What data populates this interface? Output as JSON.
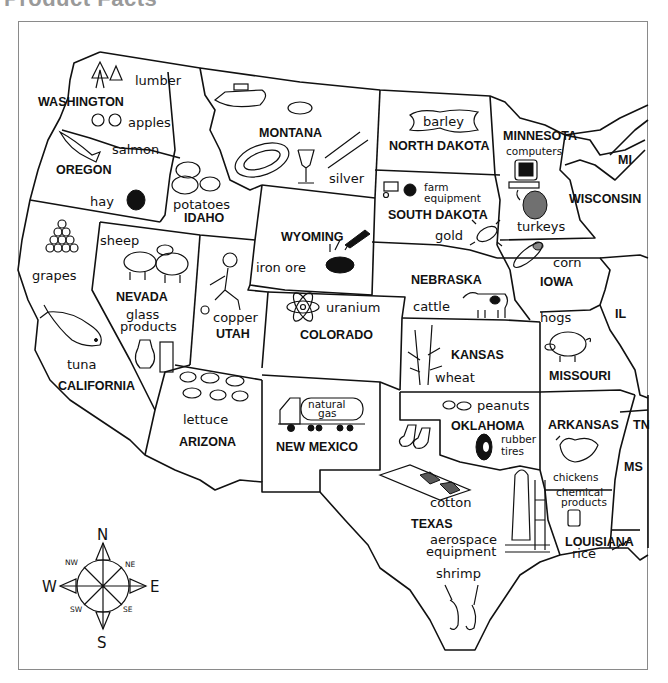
{
  "page": {
    "title": "Product Facts"
  },
  "states": [
    {
      "name": "WASHINGTON",
      "products": [
        "lumber",
        "apples"
      ]
    },
    {
      "name": "OREGON",
      "products": [
        "salmon",
        "hay"
      ]
    },
    {
      "name": "IDAHO",
      "products": [
        "potatoes"
      ]
    },
    {
      "name": "MONTANA",
      "products": [
        "silver"
      ]
    },
    {
      "name": "NORTH DAKOTA",
      "products": [
        "barley"
      ]
    },
    {
      "name": "MINNESOTA",
      "products": [
        "computers",
        "turkeys"
      ]
    },
    {
      "name": "MI",
      "products": []
    },
    {
      "name": "WISCONSIN",
      "products": []
    },
    {
      "name": "SOUTH DAKOTA",
      "products": [
        "farm",
        "equipment",
        "gold"
      ]
    },
    {
      "name": "WYOMING",
      "products": [
        "iron ore"
      ]
    },
    {
      "name": "CALIFORNIA",
      "products": [
        "grapes",
        "tuna"
      ]
    },
    {
      "name": "NEVADA",
      "products": [
        "sheep",
        "glass",
        "products"
      ]
    },
    {
      "name": "UTAH",
      "products": [
        "copper"
      ]
    },
    {
      "name": "COLORADO",
      "products": [
        "uranium"
      ]
    },
    {
      "name": "NEBRASKA",
      "products": [
        "cattle"
      ]
    },
    {
      "name": "IOWA",
      "products": [
        "corn"
      ]
    },
    {
      "name": "IL",
      "products": []
    },
    {
      "name": "KANSAS",
      "products": [
        "wheat"
      ]
    },
    {
      "name": "MISSOURI",
      "products": [
        "hogs"
      ]
    },
    {
      "name": "ARIZONA",
      "products": [
        "lettuce"
      ]
    },
    {
      "name": "NEW MEXICO",
      "products": [
        "natural",
        "gas"
      ]
    },
    {
      "name": "OKLAHOMA",
      "products": [
        "peanuts",
        "rubber",
        "tires"
      ]
    },
    {
      "name": "ARKANSAS",
      "products": [
        "chickens"
      ]
    },
    {
      "name": "TN",
      "products": []
    },
    {
      "name": "MS",
      "products": []
    },
    {
      "name": "LOUISIANA",
      "products": [
        "chemical",
        "products",
        "rice"
      ]
    },
    {
      "name": "TEXAS",
      "products": [
        "cotton",
        "aerospace",
        "equipment",
        "shrimp"
      ]
    }
  ],
  "compass": {
    "n": "N",
    "s": "S",
    "e": "E",
    "w": "W",
    "ne": "NE",
    "nw": "NW",
    "se": "SE",
    "sw": "SW"
  },
  "colors": {
    "ink": "#111111",
    "frame": "#8a8a8a",
    "background": "#ffffff"
  }
}
